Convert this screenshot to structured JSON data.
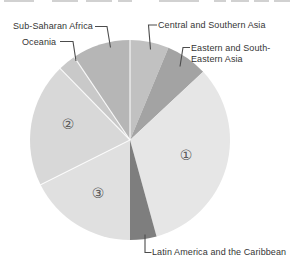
{
  "figure": {
    "background": "#ffffff",
    "note_top_edge": "cropped remnants of text above chart"
  },
  "chart_data": {
    "type": "pie",
    "title": "",
    "legend_position": "none",
    "label_style": "callout-leader-lines",
    "center_px": {
      "x": 130,
      "y": 140
    },
    "radius_px": 100,
    "angle_origin": "12-o'clock, clockwise",
    "divider_color": "#ffffff",
    "leader_color": "#4c4c4c",
    "slices": [
      {
        "label": "Central and Southern Asia",
        "start_deg": 0,
        "end_deg": 22.6,
        "approx_pct": 6.3,
        "color": "#c1c1c1",
        "divider_before": true
      },
      {
        "label": "Eastern and South-Eastern Asia",
        "start_deg": 22.6,
        "end_deg": 47.0,
        "approx_pct": 6.8,
        "color": "#a3a3a3",
        "divider_before": false
      },
      {
        "label": "①",
        "start_deg": 47.0,
        "end_deg": 164.6,
        "approx_pct": 32.7,
        "color": "#e6e6e6",
        "divider_before": false
      },
      {
        "label": "Latin America and the Caribbean",
        "start_deg": 164.6,
        "end_deg": 180.0,
        "approx_pct": 4.3,
        "color": "#7e7e7e",
        "divider_before": false
      },
      {
        "label": "③",
        "start_deg": 180.0,
        "end_deg": 243.4,
        "approx_pct": 17.6,
        "color": "#e0e0e0",
        "divider_before": false
      },
      {
        "label": "②",
        "start_deg": 243.4,
        "end_deg": 315.7,
        "approx_pct": 20.1,
        "color": "#d8d8d8",
        "divider_before": true
      },
      {
        "label": "Oceania",
        "start_deg": 315.7,
        "end_deg": 326.1,
        "approx_pct": 2.9,
        "color": "#c9c9c9",
        "divider_before": true
      },
      {
        "label": "Sub-Saharan Africa",
        "start_deg": 326.1,
        "end_deg": 360.0,
        "approx_pct": 9.4,
        "color": "#b6b6b6",
        "divider_before": true
      }
    ]
  }
}
